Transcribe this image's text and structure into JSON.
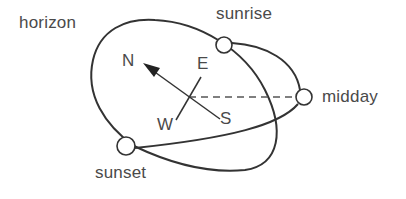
{
  "diagram": {
    "type": "sun-path-diagram",
    "labels": {
      "horizon": "horizon",
      "sunrise": "sunrise",
      "midday": "midday",
      "sunset": "sunset"
    },
    "compass": {
      "north": "N",
      "east": "E",
      "south": "S",
      "west": "W"
    },
    "colors": {
      "stroke": "#333333",
      "text": "#4a4a4a",
      "background": "#ffffff",
      "sun_fill": "#ffffff"
    }
  }
}
